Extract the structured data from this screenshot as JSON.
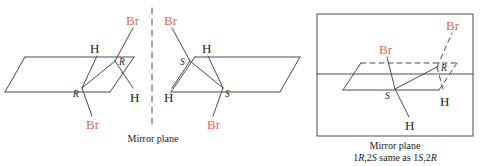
{
  "figure": {
    "kind": "stereochemistry-diagram",
    "bond_color": "#4a4a4a",
    "halogen_color": "#e2664f",
    "text_color": "#1a1a1a"
  },
  "left_panel": {
    "mirror_caption": "Mirror plane",
    "molecule_rr": {
      "name": "1R,2R-dibromide",
      "labels": {
        "br_top": "Br",
        "br_bottom": "Br",
        "h_top": "H",
        "h_bottom": "H",
        "stereo_top": "R",
        "stereo_bottom": "R"
      }
    },
    "molecule_ss": {
      "name": "1S,2S-dibromide",
      "labels": {
        "br_top": "Br",
        "br_bottom": "Br",
        "h_top": "H",
        "h_bottom": "H",
        "stereo_top": "S",
        "stereo_bottom": "S"
      }
    }
  },
  "right_panel": {
    "molecule_meso": {
      "name": "meso-dibromide",
      "labels": {
        "br_upper_right": "Br",
        "br_inner": "Br",
        "h_right": "H",
        "h_bottom": "H",
        "stereo_r": "R",
        "stereo_s": "S"
      }
    },
    "caption_line_1": "Mirror plane",
    "caption_line_2_prefix": "1",
    "caption_line_2_r1": "R",
    "caption_line_2_mid1": ",2",
    "caption_line_2_s1": "S",
    "caption_line_2_mid2": " same as 1",
    "caption_line_2_s2": "S",
    "caption_line_2_mid3": ",2",
    "caption_line_2_r2": "R"
  }
}
